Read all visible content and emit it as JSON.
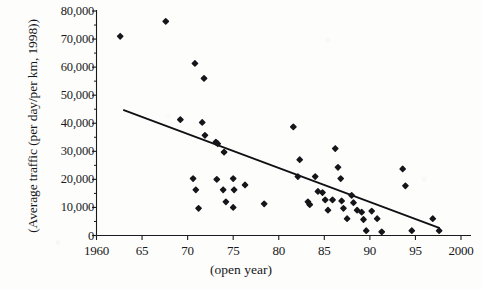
{
  "chart_data": {
    "type": "scatter",
    "title": "",
    "xlabel": "(open year)",
    "ylabel": "(Average traffic (per day/per km, 1998))",
    "xlim": [
      1960,
      2000
    ],
    "ylim": [
      0,
      80000
    ],
    "xticks": [
      1960,
      1965,
      1970,
      1975,
      1980,
      1985,
      1990,
      1995,
      2000
    ],
    "xtick_labels": [
      "1960",
      "65",
      "70",
      "75",
      "80",
      "85",
      "90",
      "95",
      "2000"
    ],
    "yticks": [
      0,
      10000,
      20000,
      30000,
      40000,
      50000,
      60000,
      70000,
      80000
    ],
    "ytick_labels": [
      "0",
      "10,000",
      "20,000",
      "30,000",
      "40,000",
      "50,000",
      "60,000",
      "70,000",
      "80,000"
    ],
    "grid": false,
    "legend": null,
    "marker": "diamond",
    "marker_color": "#15151a",
    "points": [
      {
        "x": 1962.6,
        "y": 71000
      },
      {
        "x": 1967.6,
        "y": 76300
      },
      {
        "x": 1970.8,
        "y": 61300
      },
      {
        "x": 1971.8,
        "y": 56000
      },
      {
        "x": 1971.6,
        "y": 40300
      },
      {
        "x": 1971.9,
        "y": 35700
      },
      {
        "x": 1973.1,
        "y": 33300
      },
      {
        "x": 1973.3,
        "y": 32700
      },
      {
        "x": 1974.0,
        "y": 29700
      },
      {
        "x": 1969.2,
        "y": 41300
      },
      {
        "x": 1970.6,
        "y": 20300
      },
      {
        "x": 1970.9,
        "y": 16300
      },
      {
        "x": 1971.2,
        "y": 9700
      },
      {
        "x": 1973.2,
        "y": 20000
      },
      {
        "x": 1973.9,
        "y": 16300
      },
      {
        "x": 1974.2,
        "y": 12000
      },
      {
        "x": 1975.0,
        "y": 20300
      },
      {
        "x": 1975.1,
        "y": 16300
      },
      {
        "x": 1975.0,
        "y": 10000
      },
      {
        "x": 1976.3,
        "y": 18000
      },
      {
        "x": 1978.4,
        "y": 11300
      },
      {
        "x": 1981.6,
        "y": 38700
      },
      {
        "x": 1982.3,
        "y": 27000
      },
      {
        "x": 1982.1,
        "y": 21000
      },
      {
        "x": 1983.2,
        "y": 12000
      },
      {
        "x": 1983.4,
        "y": 11000
      },
      {
        "x": 1984.3,
        "y": 15700
      },
      {
        "x": 1984.8,
        "y": 15300
      },
      {
        "x": 1985.1,
        "y": 12700
      },
      {
        "x": 1985.4,
        "y": 9000
      },
      {
        "x": 1985.9,
        "y": 12700
      },
      {
        "x": 1986.2,
        "y": 31000
      },
      {
        "x": 1986.5,
        "y": 24300
      },
      {
        "x": 1986.8,
        "y": 20300
      },
      {
        "x": 1986.9,
        "y": 12300
      },
      {
        "x": 1987.1,
        "y": 9700
      },
      {
        "x": 1987.5,
        "y": 6000
      },
      {
        "x": 1988.2,
        "y": 11700
      },
      {
        "x": 1988.6,
        "y": 9000
      },
      {
        "x": 1989.1,
        "y": 8300
      },
      {
        "x": 1989.3,
        "y": 5700
      },
      {
        "x": 1989.6,
        "y": 1700
      },
      {
        "x": 1990.2,
        "y": 8700
      },
      {
        "x": 1990.8,
        "y": 6000
      },
      {
        "x": 1991.3,
        "y": 1300
      },
      {
        "x": 1993.6,
        "y": 23700
      },
      {
        "x": 1993.9,
        "y": 17700
      },
      {
        "x": 1994.6,
        "y": 1700
      },
      {
        "x": 1996.9,
        "y": 6000
      },
      {
        "x": 1997.6,
        "y": 1700
      },
      {
        "x": 1984.0,
        "y": 21000
      },
      {
        "x": 1988.0,
        "y": 14300
      }
    ],
    "trendline": {
      "x_start": 1963.0,
      "y_start": 44700,
      "x_end": 1997.6,
      "y_end": 2700,
      "color": "#111115",
      "width": 1.8
    }
  },
  "meta": {
    "background_color": "#fdfdfb",
    "axis_color": "#1a1a1e",
    "text_color": "#18181c"
  }
}
